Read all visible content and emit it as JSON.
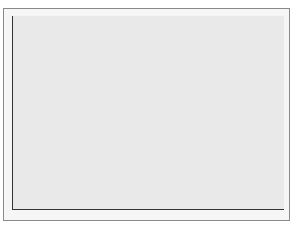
{
  "chart_data": {
    "type": "bar",
    "subtype": "horizontal-range (gantt)",
    "title": "",
    "xlabel": "Days after challenge",
    "ylabel": "",
    "xlim": [
      0,
      5
    ],
    "xticks": [
      0,
      1,
      2,
      3,
      4,
      5
    ],
    "grid": false,
    "legend": null,
    "series": [
      {
        "name": "Diarrhea",
        "start": 1.55,
        "end": 3.05
      },
      {
        "name": "Vomiting",
        "start": 1.15,
        "end": 2.1
      },
      {
        "name": "Abdominal cramps",
        "start": 1.0,
        "end": 3.15
      },
      {
        "name": "Nausea",
        "start": 1.0,
        "end": 2.15
      },
      {
        "name": "Headache",
        "start": 2.0,
        "end": 3.15
      },
      {
        "name": "Anorexia and malaise",
        "start": 1.55,
        "end": 3.15
      },
      {
        "name": "Fever",
        "start": 1.15,
        "end": 1.9
      }
    ]
  },
  "colors": {
    "plot_bg": "#e9e9e9",
    "frame_bg": "#f6f6f6",
    "bar": "#333333"
  }
}
